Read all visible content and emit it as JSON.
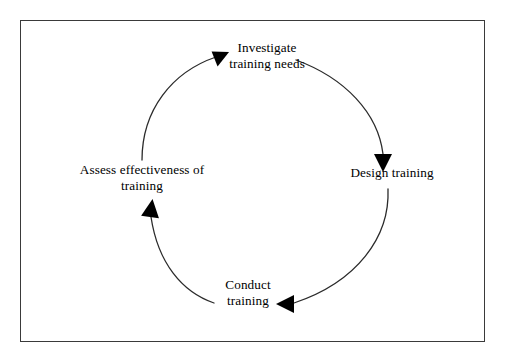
{
  "diagram": {
    "type": "circular-process-cycle",
    "shape": "clockwise circular loop with four arrowheads",
    "frame": {
      "border_color": "#3a3a3a",
      "background_color": "#ffffff"
    },
    "stroke_color": "#2b2b2b",
    "arrow_color": "#000000",
    "text_color": "#000000",
    "nodes": [
      {
        "id": "investigate",
        "position": "top",
        "line1": "Investigate",
        "line2": "training needs"
      },
      {
        "id": "design",
        "position": "right",
        "line1": "Design training",
        "line2": ""
      },
      {
        "id": "conduct",
        "position": "bottom",
        "line1": "Conduct",
        "line2": "training"
      },
      {
        "id": "assess",
        "position": "left",
        "line1": "Assess effectiveness of",
        "line2": "training"
      }
    ]
  }
}
